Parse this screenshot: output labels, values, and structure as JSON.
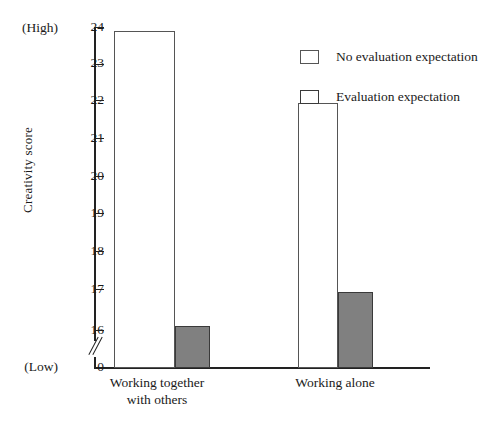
{
  "chart_data": {
    "type": "bar",
    "title": "",
    "xlabel": "",
    "ylabel": "Creativity score",
    "categories": [
      "Working together with others",
      "Working alone"
    ],
    "series": [
      {
        "name": "No evaluation expectation",
        "values": [
          23.9,
          22.0
        ],
        "style": "open",
        "color": "#ffffff",
        "border_color": "#555555"
      },
      {
        "name": "Evaluation expectation",
        "values": [
          16.1,
          17.0
        ],
        "style": "filled",
        "color": "#808080",
        "border_color": "#3a3a3a"
      }
    ],
    "ylim": [
      16,
      24
    ],
    "yticks": [
      24,
      23,
      22,
      21,
      20,
      19,
      18,
      17,
      16,
      0
    ],
    "ytick_labels": [
      "24",
      "23",
      "22",
      "21",
      "20",
      "19",
      "18",
      "17",
      "16",
      "0"
    ],
    "axis_break": true,
    "axis_break_between": [
      16,
      0
    ],
    "grid": false,
    "legend_position": "top-right",
    "scale_endpoints": {
      "high_label": "(High)",
      "low_label": "(Low)"
    }
  },
  "axis": {
    "y_title": "Creativity score",
    "high_label": "(High)",
    "low_label": "(Low)",
    "ticks": [
      {
        "label": "24",
        "value": 24
      },
      {
        "label": "23",
        "value": 23
      },
      {
        "label": "22",
        "value": 22
      },
      {
        "label": "21",
        "value": 21
      },
      {
        "label": "20",
        "value": 20
      },
      {
        "label": "19",
        "value": 19
      },
      {
        "label": "18",
        "value": 18
      },
      {
        "label": "17",
        "value": 17
      },
      {
        "label": "16",
        "value": 16
      },
      {
        "label": "0",
        "value": 0
      }
    ]
  },
  "categories": [
    {
      "line1": "Working together",
      "line2": "with others"
    },
    {
      "line1": "Working alone",
      "line2": ""
    }
  ],
  "legend": {
    "items": [
      {
        "label": "No evaluation expectation",
        "style": "open"
      },
      {
        "label": "Evaluation expectation",
        "style": "filled"
      }
    ]
  },
  "colors": {
    "filled_bar": "#808080",
    "bar_outline": "#555555",
    "axis": "#222222"
  }
}
